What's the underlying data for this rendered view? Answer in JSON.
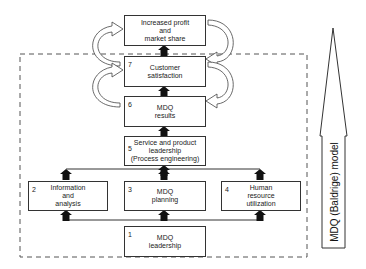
{
  "diagram": {
    "title": "MDQ (Baldrige) model",
    "boxes": [
      {
        "id": "profit",
        "number": "",
        "label": "Increased profit\nand\nmarket share"
      },
      {
        "id": "customer",
        "number": "7",
        "label": "Customer\nsatisfaction"
      },
      {
        "id": "results",
        "number": "6",
        "label": "MDQ\nresults"
      },
      {
        "id": "service",
        "number": "5",
        "label": "Service and product\nleadership\n(Process engineering)"
      },
      {
        "id": "info",
        "number": "2",
        "label": "Information\nand\nanalysis"
      },
      {
        "id": "planning",
        "number": "3",
        "label": "MDQ\nplanning"
      },
      {
        "id": "hr",
        "number": "4",
        "label": "Human\nresource\nutilization"
      },
      {
        "id": "leadership",
        "number": "1",
        "label": "MDQ\nleadership"
      }
    ],
    "side_arrow_label": "MDQ (Baldrige) model",
    "colors": {
      "line": "#333333",
      "arrow_fill": "#111111",
      "dash": "#555555",
      "background": "#ffffff"
    }
  }
}
